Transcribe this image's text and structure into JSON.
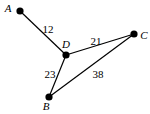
{
  "diagram": {
    "type": "weighted-graph",
    "nodes": [
      {
        "id": "A",
        "label": "A"
      },
      {
        "id": "B",
        "label": "B"
      },
      {
        "id": "C",
        "label": "C"
      },
      {
        "id": "D",
        "label": "D"
      }
    ],
    "edges": [
      {
        "from": "A",
        "to": "D",
        "weight": "12"
      },
      {
        "from": "D",
        "to": "C",
        "weight": "21"
      },
      {
        "from": "D",
        "to": "B",
        "weight": "23"
      },
      {
        "from": "B",
        "to": "C",
        "weight": "38"
      }
    ]
  }
}
